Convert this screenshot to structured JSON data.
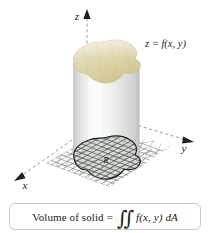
{
  "figure": {
    "axes": {
      "z_label": "z",
      "x_label": "x",
      "y_label": "y"
    },
    "surface_label": "z = f(x, y)",
    "region_label": "R",
    "colors": {
      "surface_top": "#ddd4a8",
      "surface_top_light": "#e8e2c4",
      "surface_top_dark": "#cfc394",
      "cylinder_body": "#f2f2f2",
      "cylinder_shadow": "#cfcfcf",
      "cylinder_highlight": "#ffffff",
      "grid_line": "#5a5a5a",
      "region_fill": "#b9c2b4",
      "region_outline": "#1a1a1a",
      "axis_dash": "#9a9a9a",
      "axis_arrow": "#231f20",
      "box_border": "#c9c9c9",
      "text": "#231f20",
      "background": "#ffffff"
    }
  },
  "formula": {
    "lead_text": "Volume of solid",
    "equals": "=",
    "integral_symbol": "∬",
    "integrand": "f(x, y)",
    "differential": "dA",
    "full_text": "Volume of solid = ∬ f(x, y) dA"
  }
}
